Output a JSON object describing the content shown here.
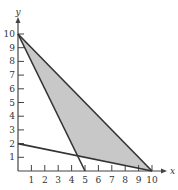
{
  "chart_data": {
    "type": "area",
    "title": "",
    "xlabel": "x",
    "ylabel": "y",
    "xlim": [
      0,
      10
    ],
    "ylim": [
      0,
      10
    ],
    "x_ticks": [
      1,
      2,
      3,
      4,
      5,
      6,
      7,
      8,
      9,
      10
    ],
    "y_ticks": [
      1,
      2,
      3,
      4,
      5,
      6,
      7,
      8,
      9,
      10
    ],
    "grid": false,
    "lines": [
      {
        "name": "line-a",
        "points": [
          [
            0,
            10
          ],
          [
            10,
            0
          ]
        ],
        "equation": "x + y = 10"
      },
      {
        "name": "line-b",
        "points": [
          [
            0,
            10
          ],
          [
            5,
            0
          ]
        ],
        "equation": "2x + y = 10"
      },
      {
        "name": "line-c",
        "points": [
          [
            0,
            2
          ],
          [
            10,
            0
          ]
        ],
        "equation": "x + 5y = 10"
      }
    ],
    "shaded_region": {
      "vertices": [
        [
          0,
          10
        ],
        [
          10,
          0
        ],
        [
          4.444,
          1.111
        ]
      ],
      "color": "#c8c8c8"
    },
    "colors": {
      "axis": "#444444",
      "line": "#333333",
      "fill": "#c8c8c8"
    }
  }
}
